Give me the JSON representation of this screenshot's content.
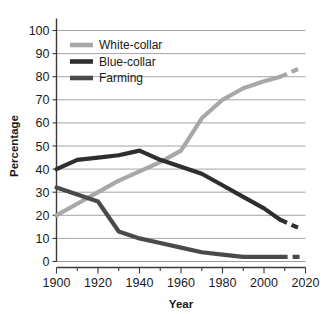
{
  "chart_data": {
    "type": "line",
    "title": "",
    "xlabel": "Year",
    "ylabel": "Percentage",
    "xlim": [
      1900,
      2020
    ],
    "ylim": [
      0,
      100
    ],
    "xticks": [
      1900,
      1920,
      1940,
      1960,
      1980,
      2000,
      2020
    ],
    "yticks": [
      0,
      10,
      20,
      30,
      40,
      50,
      60,
      70,
      80,
      90,
      100
    ],
    "xtick_labels": [
      "1900",
      "1920",
      "1940",
      "1960",
      "1980",
      "2000",
      "2020"
    ],
    "ytick_labels": [
      "0",
      "10",
      "20",
      "30",
      "40",
      "50",
      "60",
      "70",
      "80",
      "90",
      "100"
    ],
    "grid": "horizontal",
    "minor_xtick_interval": 10,
    "legend_position": "upper-left-inside",
    "series": [
      {
        "name": "White-collar",
        "color": "#a8a8a8",
        "x": [
          1900,
          1910,
          1920,
          1930,
          1940,
          1950,
          1960,
          1970,
          1980,
          1990,
          2000,
          2008
        ],
        "values": [
          20,
          25,
          30,
          35,
          39,
          43,
          48,
          62,
          70,
          75,
          78,
          80
        ],
        "projected_x": [
          2008,
          2018
        ],
        "projected_values": [
          80,
          84
        ],
        "projected_style": "dashed"
      },
      {
        "name": "Blue-collar",
        "color": "#2e2e2e",
        "x": [
          1900,
          1910,
          1920,
          1930,
          1940,
          1950,
          1960,
          1970,
          1980,
          1990,
          2000,
          2008
        ],
        "values": [
          40,
          44,
          45,
          46,
          48,
          44,
          41,
          38,
          33,
          28,
          23,
          18
        ],
        "projected_x": [
          2008,
          2018
        ],
        "projected_values": [
          18,
          14
        ],
        "projected_style": "dashed"
      },
      {
        "name": "Farming",
        "color": "#4a4a4a",
        "x": [
          1900,
          1910,
          1920,
          1930,
          1940,
          1950,
          1960,
          1970,
          1980,
          1990,
          2000,
          2008
        ],
        "values": [
          32,
          29,
          26,
          13,
          10,
          8,
          6,
          4,
          3,
          2,
          2,
          2
        ],
        "projected_x": [
          2008,
          2018
        ],
        "projected_values": [
          2,
          2
        ],
        "projected_style": "dashed"
      }
    ]
  },
  "legend": {
    "items": [
      {
        "label": "White-collar",
        "color": "#a8a8a8"
      },
      {
        "label": "Blue-collar",
        "color": "#2e2e2e"
      },
      {
        "label": "Farming",
        "color": "#4a4a4a"
      }
    ]
  },
  "axes": {
    "y_title": "Percentage",
    "x_title": "Year"
  }
}
